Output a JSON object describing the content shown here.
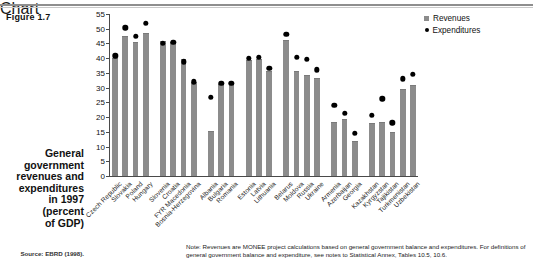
{
  "figure": {
    "label": "Figure 1.7",
    "caption_lines": [
      "General",
      "government",
      "revenues and",
      "expenditures",
      "in 1997",
      "(percent",
      "of GDP)"
    ],
    "source": "Source: EBRD (1998).",
    "note": "Note: Revenues are MONEE project calculations based on general government balance and expenditures. For definitions of general government balance and expenditure, see notes to Statistical Annex, Tables 10.5, 10.6."
  },
  "legend": {
    "position": "top-right",
    "items": [
      {
        "label": "Revenues",
        "marker": "square",
        "color": "#8c8c8c"
      },
      {
        "label": "Expenditures",
        "marker": "dot",
        "color": "#000000"
      }
    ]
  },
  "chart_data": {
    "type": "bar",
    "title": "General government revenues and expenditures in 1997 (percent of GDP)",
    "xlabel": "",
    "ylabel": "",
    "ylim": [
      0,
      55
    ],
    "yticks": [
      0,
      5,
      10,
      15,
      20,
      25,
      30,
      35,
      40,
      45,
      50,
      55
    ],
    "grid": false,
    "categories": [
      "Czech Republic",
      "Slovakia",
      "Poland",
      "Hungary",
      "Slovenia",
      "Croatia",
      "FYR Macedonia",
      "Bosnia-Herzegovina",
      "Albania",
      "Bulgaria",
      "Romania",
      "Estonia",
      "Latvia",
      "Lithuania",
      "Belarus",
      "Moldova",
      "Russia",
      "Ukraine",
      "Armenia",
      "Azerbaijan",
      "Georgia",
      "Kazakhstan",
      "Kyrgyzstan",
      "Tajikistan",
      "Turkmenistan",
      "Uzbekistan"
    ],
    "groups": [
      {
        "name": "Central Europe",
        "count": 4
      },
      {
        "name": "Southeastern Europe",
        "count": 4
      },
      {
        "name": "Balkans",
        "count": 3
      },
      {
        "name": "Baltics",
        "count": 3
      },
      {
        "name": "Western CIS",
        "count": 4
      },
      {
        "name": "Caucasus",
        "count": 3
      },
      {
        "name": "Central Asia",
        "count": 5
      }
    ],
    "series": [
      {
        "name": "Revenues",
        "type": "bar",
        "color": "#8c8c8c",
        "values": [
          39.7,
          47.2,
          45.2,
          48.2,
          45.6,
          45.0,
          39.3,
          31.7,
          14.9,
          30.8,
          30.9,
          38.9,
          39.3,
          35.2,
          45.8,
          35.2,
          33.9,
          33.0,
          18.0,
          18.9,
          11.5,
          17.5,
          17.9,
          14.5,
          29.2,
          30.5
        ],
        "ylim": [
          0,
          55
        ]
      },
      {
        "name": "Expenditures",
        "type": "scatter",
        "color": "#000000",
        "values": [
          41.8,
          51.3,
          48.4,
          52.9,
          46.0,
          46.4,
          39.7,
          33.0,
          27.6,
          32.4,
          32.5,
          41.0,
          41.2,
          37.6,
          49.1,
          41.2,
          40.6,
          37.0,
          25.0,
          22.3,
          15.5,
          21.6,
          27.2,
          19.0,
          33.9,
          35.5
        ],
        "ylim": [
          0,
          55
        ]
      }
    ]
  }
}
